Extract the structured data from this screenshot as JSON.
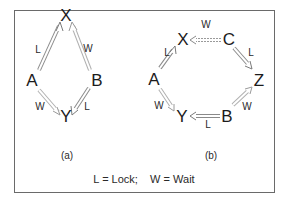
{
  "diagram": {
    "panel_a": {
      "caption": "(a)",
      "nodes": [
        {
          "id": "X",
          "label": "X",
          "x": 66,
          "y": 15
        },
        {
          "id": "A",
          "label": "A",
          "x": 32,
          "y": 80
        },
        {
          "id": "B",
          "label": "B",
          "x": 97,
          "y": 80
        },
        {
          "id": "Y",
          "label": "Y",
          "x": 66,
          "y": 116
        }
      ],
      "edges": [
        {
          "from": "A",
          "to": "X",
          "label": "L",
          "lx": 38,
          "ly": 50
        },
        {
          "from": "B",
          "to": "X",
          "label": "W",
          "lx": 88,
          "ly": 49
        },
        {
          "from": "A",
          "to": "Y",
          "label": "W",
          "lx": 40,
          "ly": 107
        },
        {
          "from": "B",
          "to": "Y",
          "label": "L",
          "lx": 87,
          "ly": 107
        }
      ]
    },
    "panel_b": {
      "caption": "(b)",
      "nodes": [
        {
          "id": "X",
          "label": "X",
          "x": 183,
          "y": 39
        },
        {
          "id": "C",
          "label": "C",
          "x": 229,
          "y": 39
        },
        {
          "id": "A",
          "label": "A",
          "x": 154,
          "y": 79
        },
        {
          "id": "Z",
          "label": "Z",
          "x": 259,
          "y": 80
        },
        {
          "id": "Y",
          "label": "Y",
          "x": 182,
          "y": 116
        },
        {
          "id": "B",
          "label": "B",
          "x": 227,
          "y": 116
        }
      ],
      "edges": [
        {
          "from": "C",
          "to": "X",
          "label": "W",
          "lx": 206,
          "ly": 25,
          "style": "dashed"
        },
        {
          "from": "C",
          "to": "Z",
          "label": "L",
          "lx": 251,
          "ly": 53
        },
        {
          "from": "A",
          "to": "X",
          "label": "L",
          "lx": 167,
          "ly": 53
        },
        {
          "from": "A",
          "to": "Y",
          "label": "W",
          "lx": 159,
          "ly": 106
        },
        {
          "from": "B",
          "to": "Z",
          "label": "W",
          "lx": 247,
          "ly": 107
        },
        {
          "from": "B",
          "to": "Y",
          "label": "L",
          "lx": 208,
          "ly": 125
        }
      ]
    },
    "legend": "L = Lock;    W = Wait",
    "colors": {
      "frame": "#6a6a6a",
      "arrow_outline": "#8a8a8a",
      "text": "#1c1c1c"
    }
  }
}
